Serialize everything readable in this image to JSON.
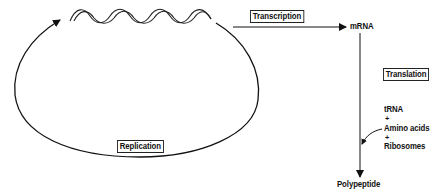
{
  "diagram": {
    "nodes": {
      "dna": {
        "label": "",
        "icon": "dna-double-helix-icon"
      },
      "mrna": {
        "label": "mRNA"
      },
      "polypeptide": {
        "label": "Polypeptide"
      }
    },
    "processes": {
      "replication": {
        "label": "Replication"
      },
      "transcription": {
        "label": "Transcription"
      },
      "translation": {
        "label": "Translation"
      }
    },
    "translation_inputs": {
      "items": [
        "tRNA",
        "+",
        "Amino acids",
        "+",
        "Ribosomes"
      ]
    },
    "edges": [
      {
        "from": "dna",
        "to": "dna",
        "label": "Replication",
        "style": "loop-arrow"
      },
      {
        "from": "dna",
        "to": "mrna",
        "label": "Transcription",
        "style": "arrow"
      },
      {
        "from": "mrna",
        "to": "polypeptide",
        "label": "Translation",
        "style": "arrow"
      },
      {
        "from": "translation_inputs",
        "to": "translation-edge",
        "label": "",
        "style": "curved-arrow"
      }
    ],
    "colors": {
      "stroke": "#111111",
      "background": "#ffffff"
    }
  }
}
